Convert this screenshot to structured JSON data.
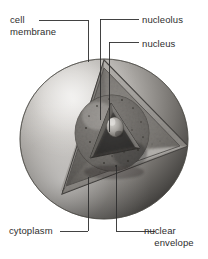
{
  "figure": {
    "background_color": "#ffffff",
    "line_color": "#2e2e2e",
    "text_color": "#2e2e2e",
    "style": "grayscale airbrush illustration"
  },
  "labels": {
    "cell_membrane": "cell membrane",
    "nucleolus": "nucleolus",
    "nucleus": "nucleus",
    "cytoplasm": "cytoplasm",
    "nuclear_envelope_line1": "nuclear",
    "nuclear_envelope_line2": "envelope"
  },
  "palette": {
    "outer_sphere_light": "#d8d6d3",
    "outer_sphere_mid": "#a9a6a2",
    "outer_sphere_dark": "#55534f",
    "outer_sphere_shadow": "#3a3937",
    "cut_face_light": "#cfccc8",
    "cut_face_mid": "#9b9894",
    "interior_dark": "#6a6763",
    "nucleus_dark": "#4a4845",
    "nucleolus": "#b9b5b0",
    "speckle": "#3d3b39"
  }
}
